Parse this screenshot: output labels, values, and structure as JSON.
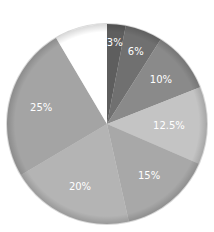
{
  "chart_data": {
    "type": "pie",
    "title": "",
    "start_angle": "12 o'clock",
    "direction": "clockwise",
    "slices": [
      {
        "label": "3%",
        "value": 3,
        "color": "#5e5e5e"
      },
      {
        "label": "6%",
        "value": 6,
        "color": "#707070"
      },
      {
        "label": "10%",
        "value": 10,
        "color": "#8a8a8a"
      },
      {
        "label": "12.5%",
        "value": 12.5,
        "color": "#c4c4c4"
      },
      {
        "label": "15%",
        "value": 15,
        "color": "#a8a8a8"
      },
      {
        "label": "20%",
        "value": 20,
        "color": "#b4b4b4"
      },
      {
        "label": "25%",
        "value": 25,
        "color": "#a4a4a4"
      },
      {
        "label": "",
        "value": 8.5,
        "color": "#ffffff"
      }
    ],
    "legend": "none"
  }
}
